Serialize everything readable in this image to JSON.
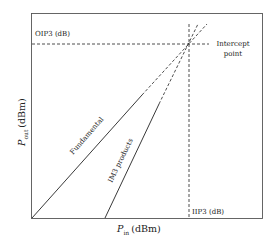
{
  "diagram": {
    "x_axis": {
      "symbol": "P",
      "subscript": "in",
      "unit": "(dBm)"
    },
    "y_axis": {
      "symbol": "P",
      "subscript": "out",
      "unit": "(dBm)"
    },
    "labels": {
      "oip3": "OIP3 (dB)",
      "iip3": "IIP3 (dB)",
      "intercept_line1": "Intercept",
      "intercept_line2": "point",
      "fundamental": "Fundamental",
      "im3": "IM3 products"
    },
    "colors": {
      "line": "#222222",
      "frame": "#555555",
      "background": "#ffffff"
    }
  }
}
